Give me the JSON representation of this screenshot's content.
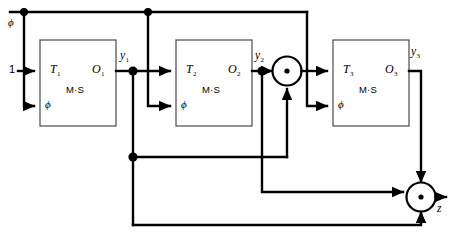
{
  "diagram": {
    "colors": {
      "wire": "#000000",
      "block_border": "#4a4a4a",
      "background": "#ffffff"
    },
    "constant_input": {
      "label": "1"
    },
    "blocks": [
      {
        "id": "stage1",
        "input_label": "T",
        "input_sub": "1",
        "output_label": "O",
        "output_sub": "1",
        "type_label": "M·S",
        "clock_label": "ϕ"
      },
      {
        "id": "stage2",
        "input_label": "T",
        "input_sub": "2",
        "output_label": "O",
        "output_sub": "2",
        "type_label": "M·S",
        "clock_label": "ϕ"
      },
      {
        "id": "stage3",
        "input_label": "T",
        "input_sub": "3",
        "output_label": "O",
        "output_sub": "3",
        "type_label": "M·S",
        "clock_label": "ϕ"
      }
    ],
    "signals": [
      {
        "id": "y1",
        "label": "y",
        "sub": "1"
      },
      {
        "id": "y2",
        "label": "y",
        "sub": "2"
      },
      {
        "id": "y3",
        "label": "y",
        "sub": "3"
      }
    ],
    "clock_rail": {
      "label": "ϕ"
    },
    "gates": [
      {
        "id": "gate1",
        "symbol": "·",
        "name": "and-gate-upper"
      },
      {
        "id": "gate2",
        "symbol": "·",
        "name": "and-gate-lower"
      }
    ],
    "output": {
      "label": "z"
    }
  }
}
